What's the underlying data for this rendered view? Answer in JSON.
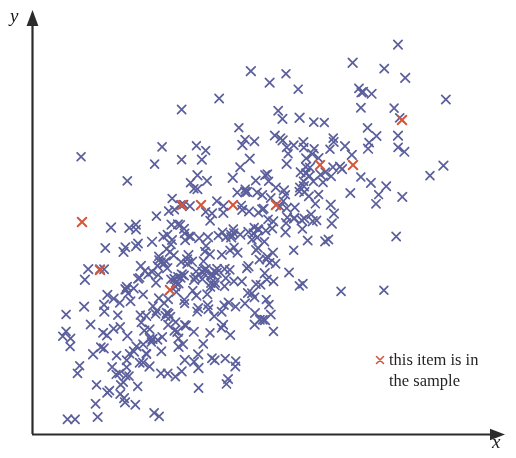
{
  "figure": {
    "type": "scatter-plot",
    "background_color": "#ffffff",
    "axis_color": "#2b2b2b"
  },
  "axes": {
    "x_label": "x",
    "y_label": "y",
    "x_axis_name": "x-axis",
    "y_axis_name": "y-axis",
    "arrowheads": true,
    "ticks": false,
    "gridlines": false,
    "origin_px": [
      32,
      434
    ],
    "x_axis_end_px": [
      505,
      434
    ],
    "y_axis_end_px": [
      32,
      10
    ]
  },
  "legend": {
    "position": "bottom-right",
    "marker": "x",
    "marker_color": "#d4573c",
    "line_1": "this item is in",
    "line_2": "the sample"
  },
  "chart_data": {
    "type": "scatter",
    "title": "",
    "xlabel": "x",
    "ylabel": "y",
    "xlim": [
      0,
      1
    ],
    "ylim": [
      0,
      1
    ],
    "grid": false,
    "legend_position": "bottom-right",
    "marker": "x",
    "series": [
      {
        "name": "population",
        "color": "#5b5f9c",
        "count": 430,
        "description": "positively correlated elongated cloud of small x markers, dense in the lower-left to center, thinning toward the upper-right"
      },
      {
        "name": "this item is in the sample",
        "color": "#d4573c",
        "count": 10,
        "points_px": [
          [
            82,
            222
          ],
          [
            100,
            270
          ],
          [
            170,
            290
          ],
          [
            182,
            205
          ],
          [
            201,
            205
          ],
          [
            233,
            205
          ],
          [
            276,
            205
          ],
          [
            320,
            165
          ],
          [
            353,
            165
          ],
          [
            402,
            120
          ]
        ]
      }
    ],
    "cloud_model": {
      "n": 430,
      "seed": 20240611,
      "x_range_px": [
        58,
        470
      ],
      "y_range_px": [
        30,
        425
      ],
      "correlation": 0.72,
      "note": "blue marker positions are generated from a seeded correlated gaussian to match the observed density"
    }
  }
}
